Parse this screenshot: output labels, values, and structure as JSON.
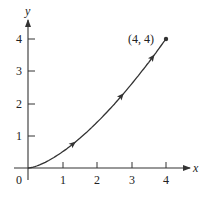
{
  "chart_data": {
    "type": "line",
    "title": "",
    "xlabel": "x",
    "ylabel": "y",
    "xlim": [
      0,
      4
    ],
    "ylim": [
      0,
      4
    ],
    "x_ticks": [
      "1",
      "2",
      "3",
      "4"
    ],
    "y_ticks": [
      "1",
      "2",
      "3",
      "4"
    ],
    "origin_label": "0",
    "grid": false,
    "legend": null,
    "series": [
      {
        "name": "path",
        "equation_estimate": "y = x^(3/2) / 2",
        "x": [
          0,
          0.5,
          1,
          1.5,
          2,
          2.5,
          3,
          3.5,
          4
        ],
        "y": [
          0,
          0.18,
          0.5,
          0.92,
          1.41,
          1.98,
          2.6,
          3.27,
          4
        ]
      }
    ],
    "direction_arrows_at_x": [
      1.3,
      2.7,
      3.6
    ],
    "annotations": [
      {
        "text": "(4, 4)",
        "x": 4,
        "y": 4,
        "marker": "dot"
      }
    ],
    "colors": {
      "curve": "#333333",
      "axes": "#333333"
    }
  }
}
